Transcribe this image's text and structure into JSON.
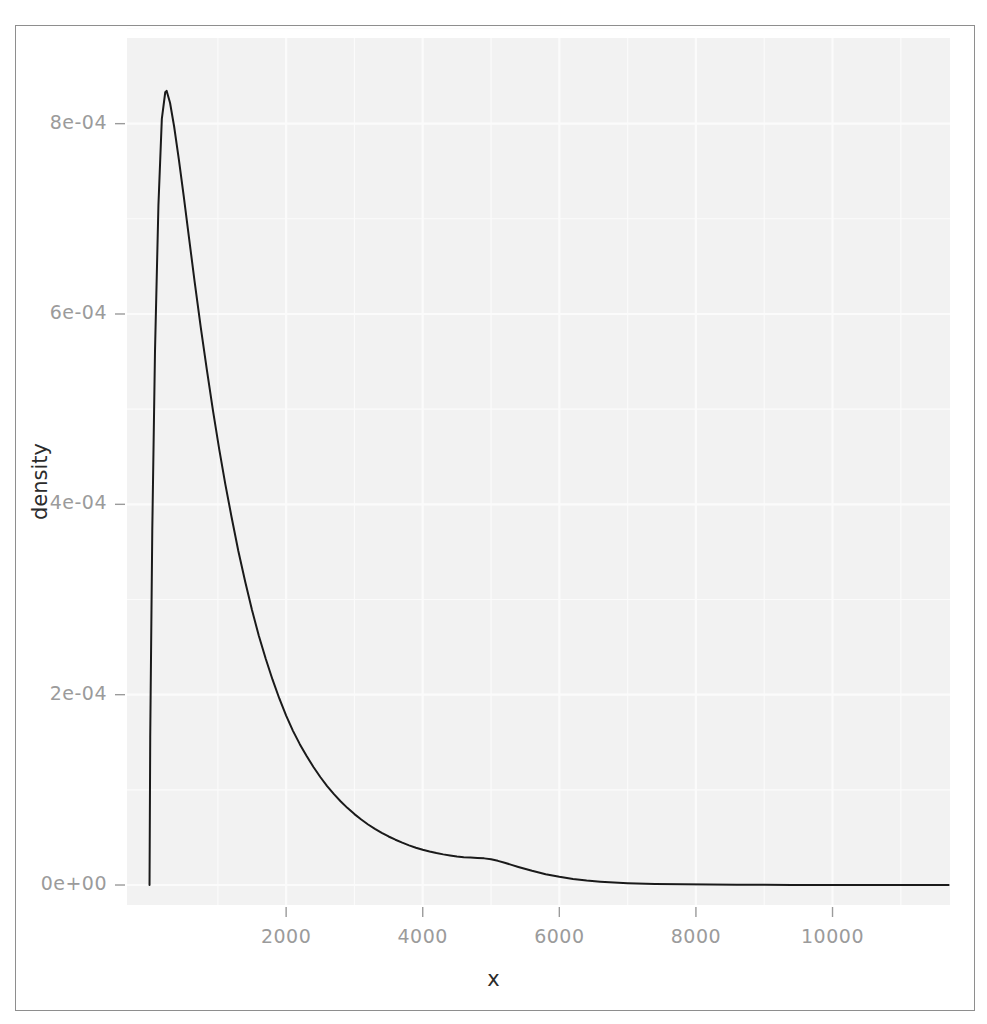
{
  "chart_data": {
    "type": "line",
    "title": "",
    "subtitle": "",
    "xlabel": "x",
    "ylabel": "density",
    "xlim": [
      -330,
      11720
    ],
    "ylim": [
      -2.1e-05,
      0.00089
    ],
    "xticks": [
      2000,
      4000,
      6000,
      8000,
      10000
    ],
    "xtick_labels": [
      "2000",
      "4000",
      "6000",
      "8000",
      "10000"
    ],
    "yticks": [
      0,
      0.0002,
      0.0004,
      0.0006,
      0.0008
    ],
    "ytick_labels": [
      "0e+00",
      "2e-04",
      "4e-04",
      "6e-04",
      "8e-04"
    ],
    "grid": true,
    "legend": null,
    "panel_background": "#f2f2f2",
    "gridline_color": "#fbfbfb",
    "line_color": "#1a1a1a",
    "line_width": 2,
    "annotations": [],
    "series": [
      {
        "name": "density",
        "x": [
          0,
          10,
          40,
          80,
          130,
          180,
          230,
          250,
          300,
          360,
          430,
          500,
          580,
          660,
          750,
          840,
          930,
          1020,
          1110,
          1200,
          1300,
          1400,
          1500,
          1600,
          1700,
          1800,
          1900,
          2000,
          2100,
          2200,
          2300,
          2400,
          2500,
          2600,
          2700,
          2800,
          2900,
          3000,
          3100,
          3200,
          3300,
          3400,
          3500,
          3600,
          3700,
          3800,
          3900,
          4000,
          4100,
          4200,
          4300,
          4400,
          4500,
          4600,
          4700,
          4800,
          4900,
          5000,
          5100,
          5200,
          5300,
          5400,
          5600,
          5800,
          6000,
          6200,
          6400,
          6600,
          6800,
          7000,
          7400,
          7800,
          8200,
          8600,
          9000,
          9400,
          9800,
          10200,
          10600,
          11000,
          11400,
          11700
        ],
        "y": [
          0.0,
          0.000155,
          0.000372,
          0.000561,
          0.000714,
          0.000805,
          0.000833,
          0.0008345,
          0.000822,
          0.000797,
          0.000762,
          0.000724,
          0.000679,
          0.000634,
          0.000586,
          0.000541,
          0.000498,
          0.000458,
          0.000421,
          0.000387,
          0.000351,
          0.000319,
          0.000289,
          0.000262,
          0.000238,
          0.000216,
          0.000196,
          0.000178,
          0.000162,
          0.000148,
          0.0001355,
          0.000124,
          0.0001135,
          0.000104,
          9.55e-05,
          8.78e-05,
          8.08e-05,
          7.45e-05,
          6.88e-05,
          6.36e-05,
          5.9e-05,
          5.48e-05,
          5.1e-05,
          4.76e-05,
          4.45e-05,
          4.17e-05,
          3.92e-05,
          3.7e-05,
          3.52e-05,
          3.36e-05,
          3.22e-05,
          3.1e-05,
          2.99e-05,
          2.92e-05,
          2.88e-05,
          2.85e-05,
          2.8e-05,
          2.7e-05,
          2.54e-05,
          2.34e-05,
          2.12e-05,
          1.9e-05,
          1.49e-05,
          1.14e-05,
          8.6e-06,
          6.4e-06,
          4.7e-06,
          3.5e-06,
          2.6e-06,
          1.9e-06,
          1.1e-06,
          7e-07,
          4.5e-07,
          3e-07,
          2e-07,
          1.4e-07,
          1e-07,
          8e-08,
          6e-08,
          5e-08,
          4e-08,
          4e-08
        ]
      }
    ]
  },
  "panel": {
    "left": 127,
    "top": 38,
    "right": 950,
    "bottom": 905
  }
}
